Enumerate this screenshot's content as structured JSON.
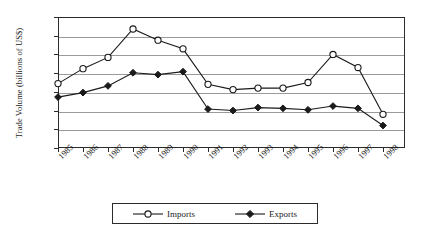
{
  "chart_data": {
    "type": "line",
    "title": "",
    "xlabel": "",
    "ylabel": "Trade Volume (billions of US$)",
    "categories": [
      "1985",
      "1986",
      "1987",
      "1988",
      "1989",
      "1990",
      "1991",
      "1992",
      "1993",
      "1994",
      "1995",
      "1996",
      "1997",
      "1998"
    ],
    "ylim": [
      0,
      3.5
    ],
    "ytick_labels": [
      "0",
      "0.5",
      "1",
      "1.5",
      "2",
      "2.5",
      "3",
      "3.5"
    ],
    "ytick_values": [
      0,
      0.5,
      1,
      1.5,
      2,
      2.5,
      3,
      3.5
    ],
    "grid": true,
    "legend_position": "bottom",
    "series": [
      {
        "name": "Imports",
        "marker": "open-circle",
        "values": [
          1.72,
          2.12,
          2.42,
          3.18,
          2.88,
          2.65,
          1.7,
          1.56,
          1.6,
          1.6,
          1.75,
          2.5,
          2.15,
          0.9
        ]
      },
      {
        "name": "Exports",
        "marker": "filled-diamond",
        "values": [
          1.36,
          1.48,
          1.66,
          2.01,
          1.96,
          2.04,
          1.04,
          1.0,
          1.08,
          1.06,
          1.02,
          1.12,
          1.06,
          0.6
        ]
      }
    ]
  },
  "legend": {
    "items": [
      {
        "label": "Imports"
      },
      {
        "label": "Exports"
      }
    ]
  }
}
